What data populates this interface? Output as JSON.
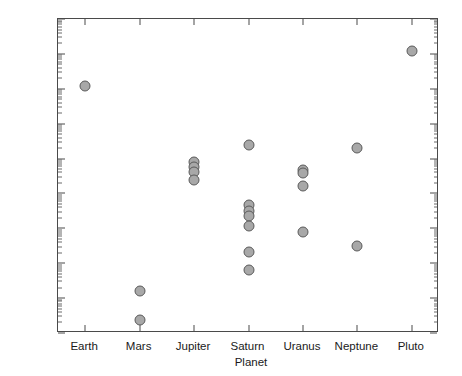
{
  "chart_data": {
    "type": "scatter",
    "title": "",
    "xlabel": "Planet",
    "ylabel": "Moon/Planet Mass Ratio",
    "yscale": "log",
    "ylim": [
      1e-09,
      1
    ],
    "grid": false,
    "legend": "none",
    "categories": [
      "Earth",
      "Mars",
      "Jupiter",
      "Saturn",
      "Uranus",
      "Neptune",
      "Pluto"
    ],
    "ytick_labels": [
      "10^0",
      "10^-1",
      "10^-2",
      "10^-3",
      "10^-4",
      "10^-5",
      "10^-6",
      "10^-7",
      "10^-8",
      "10^-9"
    ],
    "ytick_values": [
      1,
      0.1,
      0.01,
      0.001,
      0.0001,
      1e-05,
      1e-06,
      1e-07,
      1e-08,
      1e-09
    ],
    "series": [
      {
        "name": "Moon/Planet Mass Ratio",
        "marker": "circle",
        "marker_face_color": "#a8a8a8",
        "marker_edge_color": "#5a5a5a",
        "points": [
          {
            "category": "Earth",
            "x": 1,
            "y": 0.012
          },
          {
            "category": "Mars",
            "x": 2,
            "y": 1.6e-08
          },
          {
            "category": "Mars",
            "x": 2,
            "y": 2.4e-09
          },
          {
            "category": "Jupiter",
            "x": 3,
            "y": 7.8e-05
          },
          {
            "category": "Jupiter",
            "x": 3,
            "y": 5.6e-05
          },
          {
            "category": "Jupiter",
            "x": 3,
            "y": 4.2e-05
          },
          {
            "category": "Jupiter",
            "x": 3,
            "y": 2.4e-05
          },
          {
            "category": "Saturn",
            "x": 4,
            "y": 0.00024
          },
          {
            "category": "Saturn",
            "x": 4,
            "y": 4.6e-06
          },
          {
            "category": "Saturn",
            "x": 4,
            "y": 3.2e-06
          },
          {
            "category": "Saturn",
            "x": 4,
            "y": 2.2e-06
          },
          {
            "category": "Saturn",
            "x": 4,
            "y": 1.2e-06
          },
          {
            "category": "Saturn",
            "x": 4,
            "y": 2.1e-07
          },
          {
            "category": "Saturn",
            "x": 4,
            "y": 6.5e-08
          },
          {
            "category": "Uranus",
            "x": 5,
            "y": 4.8e-05
          },
          {
            "category": "Uranus",
            "x": 5,
            "y": 3.8e-05
          },
          {
            "category": "Uranus",
            "x": 5,
            "y": 1.6e-05
          },
          {
            "category": "Uranus",
            "x": 5,
            "y": 7.8e-07
          },
          {
            "category": "Neptune",
            "x": 6,
            "y": 0.0002
          },
          {
            "category": "Neptune",
            "x": 6,
            "y": 3.2e-07
          },
          {
            "category": "Pluto",
            "x": 7,
            "y": 0.12
          }
        ]
      }
    ]
  }
}
